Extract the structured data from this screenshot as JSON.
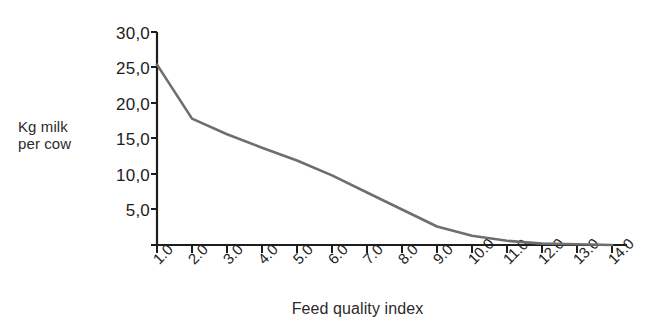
{
  "chart_data": {
    "type": "line",
    "title": "",
    "xlabel": "Feed quality index",
    "ylabel": "Kg milk per cow",
    "ylabel_line1": "Kg milk",
    "ylabel_line2": "per cow",
    "x": [
      1.0,
      2.0,
      3.0,
      4.0,
      5.0,
      6.0,
      7.0,
      8.0,
      9.0,
      10.0,
      11.0,
      12.0,
      13.0,
      14.0
    ],
    "values": [
      25.4,
      17.8,
      15.6,
      13.7,
      11.9,
      9.8,
      7.4,
      5.0,
      2.6,
      1.3,
      0.6,
      0.2,
      0.1,
      0.0
    ],
    "series": [
      {
        "name": "Kg milk per cow",
        "color": "#6e6e6e",
        "values": [
          25.4,
          17.8,
          15.6,
          13.7,
          11.9,
          9.8,
          7.4,
          5.0,
          2.6,
          1.3,
          0.6,
          0.2,
          0.1,
          0.0
        ]
      }
    ],
    "x_tick_labels": [
      "1.0",
      "2.0",
      "3.0",
      "4.0",
      "5.0",
      "6.0",
      "7.0",
      "8.0",
      "9.0",
      "10.0",
      "11.0",
      "12.0",
      "13.0",
      "14.0"
    ],
    "y_tick_labels": [
      "30,0",
      "25,0",
      "20,0",
      "15,0",
      "10,0",
      "5,0"
    ],
    "y_tick_values": [
      30,
      25,
      20,
      15,
      10,
      5
    ],
    "xlim": [
      1.0,
      14.0
    ],
    "ylim": [
      0,
      30
    ],
    "grid": false,
    "legend": false,
    "legend_position": "none",
    "axis_color": "#1d1d1d",
    "line_color": "#6e6e6e",
    "background_color": "#ffffff"
  }
}
